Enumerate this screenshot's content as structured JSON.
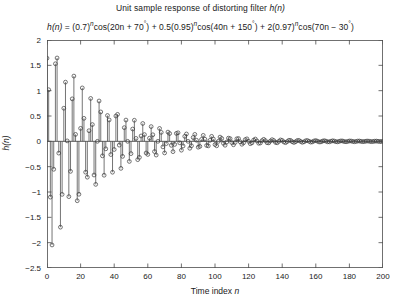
{
  "chart_data": {
    "type": "line",
    "plot_style": "stem",
    "title": "Unit sample response of distorting filter h(n)",
    "title_plain": "Unit sample response of distorting filter ",
    "title_italic_var": "h(n)",
    "equation": "h(n) = (0.7)^n cos(20n + 70°) + 0.5(0.95)^n cos(40n + 150°) + 2(0.97)^n cos(70n − 30°)",
    "equation_parts": {
      "lhs": "h(n)",
      "eq": " = ",
      "t1_base": "(0.7)",
      "t1_exp": "n",
      "t1_fn": "cos(20n + 70",
      "t1_deg": "°",
      "t1_close": ")",
      "plus1": " + ",
      "t2_coef": "0.5(0.95)",
      "t2_exp": "n",
      "t2_fn": "cos(40n + 150",
      "t2_deg": "°",
      "t2_close": ")",
      "plus2": " + ",
      "t3_coef": "2(0.97)",
      "t3_exp": "n",
      "t3_fn": "cos(70n − 30",
      "t3_deg": "°",
      "t3_close": ")"
    },
    "xlabel": "Time index n",
    "xlabel_plain": "Time index ",
    "xlabel_italic": "n",
    "ylabel": "h(n)",
    "xlim": [
      0,
      200
    ],
    "ylim": [
      -2.5,
      2
    ],
    "xticks": [
      0,
      20,
      40,
      60,
      80,
      100,
      120,
      140,
      160,
      180,
      200
    ],
    "xticklabels": [
      "0",
      "20",
      "40",
      "60",
      "80",
      "100",
      "120",
      "140",
      "160",
      "180",
      "200"
    ],
    "yticks": [
      -2.5,
      -2,
      -1.5,
      -1,
      -0.5,
      0,
      0.5,
      1,
      1.5,
      2
    ],
    "yticklabels": [
      "-2.5",
      "-2",
      "-1.5",
      "-1",
      "-0.5",
      "0",
      "0.5",
      "1",
      "1.5",
      "2"
    ],
    "grid": false,
    "legend": null,
    "line_color": "#3a3a3a",
    "marker": "open-circle",
    "marker_radius_px": 1.9,
    "params": {
      "a1": 1.0,
      "r1": 0.7,
      "w1_deg_per_sample": 20,
      "p1_deg": 70,
      "a2": 0.5,
      "r2": 0.95,
      "w2_deg_per_sample": 40,
      "p2_deg": 150,
      "a3": 2.0,
      "r3": 0.97,
      "w3_deg_per_sample": 70,
      "p3_deg": -30
    },
    "n_start": 0,
    "n_end": 200,
    "y_sample_preview": [
      1.65,
      1.0,
      -1.11,
      -2.05,
      1.7,
      -0.56,
      1.21,
      -1.75,
      0.14,
      -1.06
    ]
  },
  "axes": {
    "box": true,
    "background": "#ffffff",
    "axis_color": "#4d4d4d"
  }
}
